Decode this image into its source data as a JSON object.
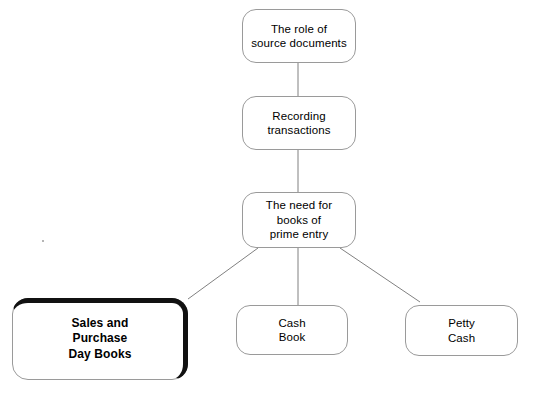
{
  "diagram": {
    "type": "flowchart",
    "background_color": "#ffffff",
    "node_stroke_color": "#9a9a9a",
    "emphasis_stroke_color": "#111111",
    "edge_color": "#808080",
    "text_color": "#000000",
    "nodes": [
      {
        "id": "role-of-source-documents",
        "label": "The role of\nsource documents",
        "x": 242,
        "y": 9,
        "w": 114,
        "h": 54,
        "emphasis": false
      },
      {
        "id": "recording-transactions",
        "label": "Recording\ntransactions",
        "x": 242,
        "y": 96,
        "w": 114,
        "h": 54,
        "emphasis": false
      },
      {
        "id": "need-for-books-of-prime-entry",
        "label": "The need for\nbooks of\nprime entry",
        "x": 242,
        "y": 192,
        "w": 114,
        "h": 56,
        "emphasis": false
      },
      {
        "id": "sales-and-purchase-day-books",
        "label": "Sales and\nPurchase\nDay Books",
        "x": 12,
        "y": 298,
        "w": 176,
        "h": 82,
        "emphasis": true
      },
      {
        "id": "cash-book",
        "label": "Cash\nBook",
        "x": 236,
        "y": 305,
        "w": 112,
        "h": 50,
        "emphasis": false
      },
      {
        "id": "petty-cash",
        "label": "Petty\nCash",
        "x": 405,
        "y": 305,
        "w": 113,
        "h": 51,
        "emphasis": false
      }
    ],
    "edges": [
      {
        "id": "edge-role-to-recording",
        "from": "role-of-source-documents",
        "to": "recording-transactions",
        "x1": 298,
        "y1": 63,
        "x2": 298,
        "y2": 96
      },
      {
        "id": "edge-recording-to-prime-entry",
        "from": "recording-transactions",
        "to": "need-for-books-of-prime-entry",
        "x1": 298,
        "y1": 150,
        "x2": 298,
        "y2": 192
      },
      {
        "id": "edge-prime-entry-to-day-books",
        "from": "need-for-books-of-prime-entry",
        "to": "sales-and-purchase-day-books",
        "x1": 258,
        "y1": 248,
        "x2": 188,
        "y2": 299
      },
      {
        "id": "edge-prime-entry-to-cash-book",
        "from": "need-for-books-of-prime-entry",
        "to": "cash-book",
        "x1": 298,
        "y1": 248,
        "x2": 298,
        "y2": 305
      },
      {
        "id": "edge-prime-entry-to-petty-cash",
        "from": "need-for-books-of-prime-entry",
        "to": "petty-cash",
        "x1": 340,
        "y1": 248,
        "x2": 420,
        "y2": 302
      }
    ],
    "artifacts": [
      {
        "id": "scan-speck",
        "x": 42,
        "y": 240
      }
    ]
  }
}
